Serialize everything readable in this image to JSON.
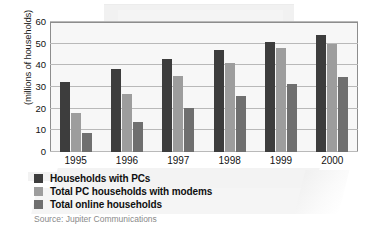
{
  "chart_data": {
    "type": "bar",
    "title": "",
    "subtitle": "",
    "xlabel": "",
    "ylabel": "(millions of households)",
    "categories": [
      "1995",
      "1996",
      "1997",
      "1998",
      "1999",
      "2000"
    ],
    "series": [
      {
        "name": "Households with PCs",
        "color": "#3d3d3d",
        "values": [
          32.5,
          38.5,
          43.0,
          47.0,
          51.0,
          54.0
        ]
      },
      {
        "name": "Total PC households with modems",
        "color": "#9d9d9d",
        "values": [
          18.0,
          27.0,
          35.0,
          41.0,
          48.0,
          50.0
        ]
      },
      {
        "name": "Total online households",
        "color": "#6f6f6f",
        "values": [
          9.0,
          14.0,
          20.5,
          26.0,
          31.5,
          34.5
        ]
      }
    ],
    "ylim": [
      0,
      60
    ],
    "yticks": [
      0,
      10,
      20,
      30,
      40,
      50,
      60
    ],
    "ytick_labels": [
      "0",
      "10",
      "20",
      "30",
      "40",
      "50",
      "60"
    ],
    "grid": true,
    "legend_position": "below-left",
    "source": "Source: Jupiter Communications"
  },
  "legend": {
    "items": [
      {
        "label": "Households with PCs",
        "color": "#3d3d3d"
      },
      {
        "label": "Total PC households with modems",
        "color": "#9d9d9d"
      },
      {
        "label": "Total online households",
        "color": "#6f6f6f"
      }
    ]
  },
  "colors": {
    "series_1": "#3d3d3d",
    "series_2": "#9d9d9d",
    "series_3": "#6f6f6f",
    "plot_background": "#f7f7f7",
    "gridline": "#b9b9b9",
    "axis_border": "#8d8d8d",
    "text": "#111111",
    "source_text": "#8a8a8a"
  }
}
